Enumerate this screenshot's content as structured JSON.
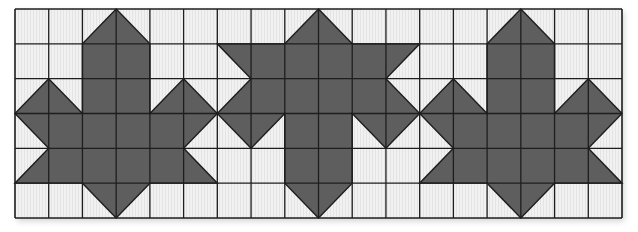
{
  "diagram": {
    "title": "",
    "type": "tessellation-grid",
    "grid": {
      "columns": 18,
      "rows": 6,
      "origin_px": [
        15,
        9
      ],
      "size_px": [
        607,
        209
      ]
    },
    "colors": {
      "fill": "#5e5e5e",
      "cell": "#f1f1f1",
      "stripe": "#e4e4e4",
      "line": "#1e1e1e"
    },
    "base_shape": [
      [
        3,
        0
      ],
      [
        4,
        1
      ],
      [
        4,
        3
      ],
      [
        5,
        2
      ],
      [
        6,
        3
      ],
      [
        5,
        4
      ],
      [
        6,
        5
      ],
      [
        4,
        5
      ],
      [
        3,
        6
      ],
      [
        2,
        5
      ],
      [
        0,
        5
      ],
      [
        1,
        4
      ],
      [
        0,
        3
      ],
      [
        1,
        2
      ],
      [
        2,
        3
      ],
      [
        2,
        1
      ]
    ],
    "shapes": [
      {
        "name": "leaf-shape-1",
        "offset_col": 0,
        "flip_vertical": false
      },
      {
        "name": "leaf-shape-2",
        "offset_col": 6,
        "flip_vertical": true
      },
      {
        "name": "leaf-shape-3",
        "offset_col": 12,
        "flip_vertical": false
      }
    ]
  }
}
